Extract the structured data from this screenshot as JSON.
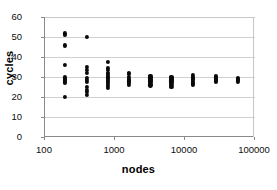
{
  "chart_data": {
    "type": "scatter",
    "title": "",
    "xlabel": "nodes",
    "ylabel": "cycles",
    "xscale": "log",
    "yscale": "linear",
    "xlim": [
      100,
      100000
    ],
    "ylim": [
      0,
      60
    ],
    "x_ticks": [
      100,
      1000,
      10000,
      100000
    ],
    "x_tick_labels": [
      "100",
      "1000",
      "10000",
      "100000"
    ],
    "y_ticks": [
      0,
      10,
      20,
      30,
      40,
      50,
      60
    ],
    "y_tick_labels": [
      "0",
      "10",
      "20",
      "30",
      "40",
      "50",
      "60"
    ],
    "grid": "horizontal",
    "legend": "none",
    "marker": "filled-circle",
    "marker_color": "#0a0a0a",
    "series": [
      {
        "name": "cycles vs nodes",
        "points": [
          [
            190,
            51.8
          ],
          [
            190,
            51.0
          ],
          [
            190,
            45.8
          ],
          [
            190,
            36.2
          ],
          [
            190,
            29.8
          ],
          [
            190,
            29.0
          ],
          [
            190,
            28.4
          ],
          [
            190,
            27.8
          ],
          [
            190,
            27.2
          ],
          [
            190,
            20.2
          ],
          [
            400,
            50.2
          ],
          [
            400,
            35.0
          ],
          [
            400,
            33.4
          ],
          [
            400,
            32.0
          ],
          [
            400,
            29.6
          ],
          [
            400,
            28.6
          ],
          [
            400,
            27.6
          ],
          [
            400,
            25.0
          ],
          [
            400,
            23.4
          ],
          [
            400,
            22.4
          ],
          [
            400,
            21.2
          ],
          [
            800,
            37.6
          ],
          [
            800,
            34.6
          ],
          [
            800,
            33.4
          ],
          [
            800,
            32.2
          ],
          [
            800,
            31.4
          ],
          [
            800,
            30.6
          ],
          [
            800,
            29.8
          ],
          [
            800,
            29.0
          ],
          [
            800,
            28.2
          ],
          [
            800,
            27.4
          ],
          [
            800,
            26.6
          ],
          [
            800,
            25.4
          ],
          [
            800,
            24.6
          ],
          [
            1600,
            32.2
          ],
          [
            1600,
            31.4
          ],
          [
            1600,
            30.0
          ],
          [
            1600,
            29.2
          ],
          [
            1600,
            28.6
          ],
          [
            1600,
            27.8
          ],
          [
            1600,
            27.0
          ],
          [
            1600,
            26.2
          ],
          [
            3200,
            30.4
          ],
          [
            3200,
            29.8
          ],
          [
            3200,
            29.2
          ],
          [
            3200,
            28.6
          ],
          [
            3200,
            28.0
          ],
          [
            3200,
            27.4
          ],
          [
            3200,
            26.6
          ],
          [
            3200,
            25.8
          ],
          [
            6400,
            30.2
          ],
          [
            6400,
            29.6
          ],
          [
            6400,
            29.0
          ],
          [
            6400,
            28.4
          ],
          [
            6400,
            27.8
          ],
          [
            6400,
            27.0
          ],
          [
            6400,
            26.2
          ],
          [
            6400,
            25.2
          ],
          [
            12800,
            31.0
          ],
          [
            12800,
            30.2
          ],
          [
            12800,
            29.6
          ],
          [
            12800,
            29.0
          ],
          [
            12800,
            28.4
          ],
          [
            12800,
            27.6
          ],
          [
            12800,
            26.8
          ],
          [
            12800,
            26.0
          ],
          [
            28000,
            30.4
          ],
          [
            28000,
            29.8
          ],
          [
            28000,
            29.2
          ],
          [
            28000,
            28.6
          ],
          [
            28000,
            28.0
          ],
          [
            28000,
            27.4
          ],
          [
            57000,
            29.6
          ],
          [
            57000,
            29.0
          ],
          [
            57000,
            28.4
          ],
          [
            57000,
            27.8
          ]
        ]
      }
    ]
  }
}
